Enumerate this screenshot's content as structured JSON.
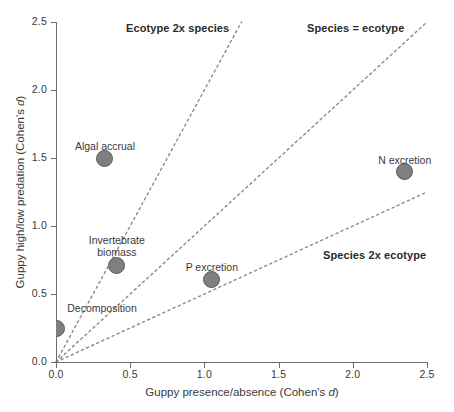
{
  "chart_data": {
    "type": "scatter",
    "title": "",
    "xlabel": "Guppy presence/absence (Cohen's d)",
    "ylabel": "Guppy high/low predation (Cohen's d)",
    "xlim": [
      0.0,
      2.5
    ],
    "ylim": [
      0.0,
      2.5
    ],
    "grid": false,
    "legend": "none",
    "xticks": [
      "0.0",
      "0.5",
      "1.0",
      "1.5",
      "2.0",
      "2.5"
    ],
    "xtick_values": [
      0.0,
      0.5,
      1.0,
      1.5,
      2.0,
      2.5
    ],
    "yticks": [
      "0.0",
      "0.5",
      "1.0",
      "1.5",
      "2.0",
      "2.5"
    ],
    "ytick_values": [
      0.0,
      0.5,
      1.0,
      1.5,
      2.0,
      2.5
    ],
    "points": [
      {
        "label": "Algal accrual",
        "x": 0.33,
        "y": 1.5,
        "label_dx": 0,
        "label_dy": -18,
        "label_lines": [
          "Algal accrual"
        ]
      },
      {
        "label": "N excretion",
        "x": 2.35,
        "y": 1.4,
        "label_dx": 0,
        "label_dy": -18,
        "label_lines": [
          "N excretion"
        ]
      },
      {
        "label": "Invertebrate biomass",
        "x": 0.41,
        "y": 0.71,
        "label_dx": 0,
        "label_dy": -31,
        "label_lines": [
          "Invertebrate",
          "biomass"
        ]
      },
      {
        "label": "P excretion",
        "x": 1.05,
        "y": 0.61,
        "label_dx": 0,
        "label_dy": -18,
        "label_lines": [
          "P excretion"
        ]
      },
      {
        "label": "Decomposition",
        "x": 0.0,
        "y": 0.25,
        "label_dx": 46,
        "label_dy": -26,
        "label_lines": [
          "Decomposition"
        ]
      }
    ],
    "reference_lines": [
      {
        "name": "Ecotype 2x species",
        "slope": 2.0,
        "x_start": 0.0,
        "x_end": 1.25,
        "annotation": "Ecotype 2x species",
        "ann_x_px": 126,
        "ann_y_px": 22
      },
      {
        "name": "Species = ecotype",
        "slope": 1.0,
        "x_start": 0.0,
        "x_end": 2.5,
        "annotation": "Species = ecotype",
        "ann_x_px": 307,
        "ann_y_px": 22
      },
      {
        "name": "Species 2x ecotype",
        "slope": 0.5,
        "x_start": 0.0,
        "x_end": 2.5,
        "annotation": "Species 2x ecotype",
        "ann_x_px": 323,
        "ann_y_px": 249
      }
    ],
    "colors": {
      "marker_fill": "#7f7f7f",
      "marker_stroke": "#5a5a5a",
      "axis": "#6e6e6e",
      "refline": "#8a8a8a",
      "text": "#3a3a3a",
      "annotation_text": "#2b2b2b",
      "background": "#ffffff"
    }
  }
}
